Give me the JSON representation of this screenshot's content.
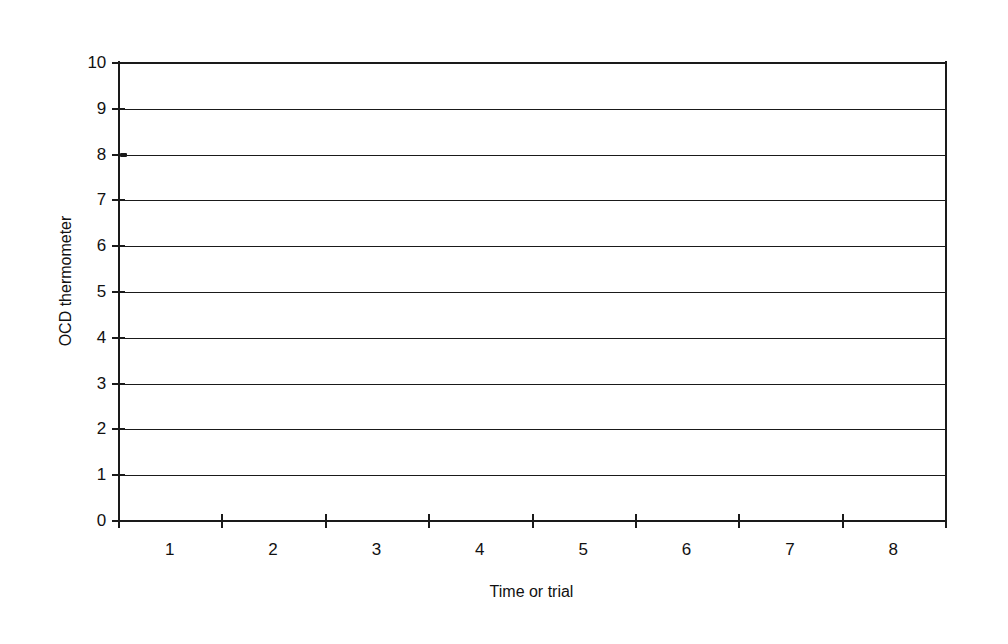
{
  "chart_data": {
    "type": "line",
    "title": "",
    "xlabel": "Time or trial",
    "ylabel": "OCD thermometer",
    "categories": [
      "1",
      "2",
      "3",
      "4",
      "5",
      "6",
      "7",
      "8"
    ],
    "x_tick_labels": [
      "1",
      "2",
      "3",
      "4",
      "5",
      "6",
      "7",
      "8"
    ],
    "y_tick_labels": [
      "10",
      "9",
      "8",
      "7",
      "6",
      "5",
      "4",
      "3",
      "2",
      "1",
      "0"
    ],
    "y_ticks": [
      10,
      9,
      8,
      7,
      6,
      5,
      4,
      3,
      2,
      1,
      0
    ],
    "ylim": [
      0,
      10
    ],
    "xlim": [
      0.5,
      8.5
    ],
    "grid": "horizontal",
    "grid_values": [
      0,
      1,
      2,
      3,
      4,
      5,
      6,
      7,
      8,
      9,
      10
    ],
    "legend": "none",
    "series": [
      {
        "name": "",
        "x": [
          0.55
        ],
        "values": [
          8
        ]
      }
    ],
    "colors": {
      "background": "#ffffff",
      "ink": "#1a1a1a",
      "grid": "#1a1a1a",
      "text": "#111111"
    }
  },
  "figure": {
    "background_color": "#ffffff"
  }
}
